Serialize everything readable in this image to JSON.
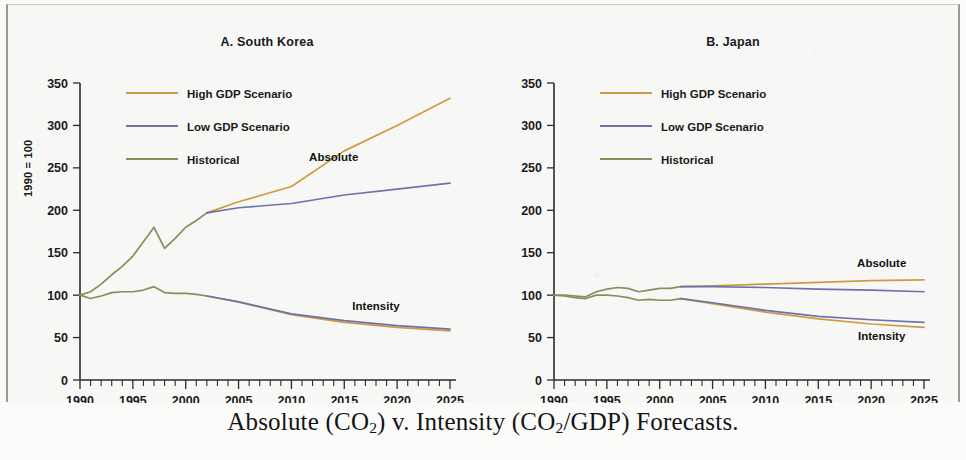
{
  "caption": {
    "prefix": "Absolute (CO",
    "sub1": "2",
    "middle": ") v. Intensity (CO",
    "sub2": "2",
    "suffix": "/GDP) Forecasts."
  },
  "axis_label_y": "1990 = 100",
  "legend": {
    "items": [
      {
        "label": "High GDP Scenario",
        "color": "#d09a42"
      },
      {
        "label": "Low GDP Scenario",
        "color": "#6e72ab"
      },
      {
        "label": "Historical",
        "color": "#8b8c5d"
      }
    ]
  },
  "annotations": {
    "absolute": "Absolute",
    "intensity": "Intensity"
  },
  "colors": {
    "high_gdp": "#d09a42",
    "low_gdp": "#6e72ab",
    "historical": "#8b8c5d",
    "axis": "#2b2b2b",
    "text": "#1a1a1a",
    "background": "#f7f8f6"
  },
  "chart_data": [
    {
      "type": "line",
      "title": "A.  South Korea",
      "xlabel": "",
      "ylabel": "1990 = 100",
      "xlim": [
        1990,
        2025
      ],
      "ylim": [
        0,
        350
      ],
      "yticks": [
        0,
        50,
        100,
        150,
        200,
        250,
        300,
        350
      ],
      "xticks": [
        1990,
        1995,
        2000,
        2005,
        2010,
        2015,
        2020,
        2025
      ],
      "xtick_minor_step": 1,
      "grid": false,
      "legend_position": "upper-left",
      "annotations": [
        {
          "text": "Absolute",
          "x": 2014,
          "y": 258
        },
        {
          "text": "Intensity",
          "x": 2018,
          "y": 82
        }
      ],
      "series": [
        {
          "name": "Historical",
          "measure": "Absolute",
          "color": "#8b8c5d",
          "x": [
            1990,
            1991,
            1992,
            1993,
            1994,
            1995,
            1996,
            1997,
            1998,
            1999,
            2000,
            2001,
            2002
          ],
          "values": [
            100,
            104,
            113,
            124,
            134,
            146,
            163,
            180,
            155,
            167,
            180,
            188,
            197
          ]
        },
        {
          "name": "Historical",
          "measure": "Intensity",
          "color": "#8b8c5d",
          "x": [
            1990,
            1991,
            1992,
            1993,
            1994,
            1995,
            1996,
            1997,
            1998,
            1999,
            2000,
            2001,
            2002
          ],
          "values": [
            100,
            96,
            99,
            103,
            104,
            104,
            106,
            110,
            103,
            102,
            102,
            101,
            99
          ]
        },
        {
          "name": "High GDP Scenario",
          "measure": "Absolute",
          "color": "#d09a42",
          "x": [
            2002,
            2005,
            2010,
            2015,
            2020,
            2025
          ],
          "values": [
            197,
            210,
            228,
            270,
            300,
            332
          ]
        },
        {
          "name": "Low GDP Scenario",
          "measure": "Absolute",
          "color": "#6e72ab",
          "x": [
            2002,
            2005,
            2010,
            2015,
            2020,
            2025
          ],
          "values": [
            197,
            203,
            208,
            218,
            225,
            232
          ]
        },
        {
          "name": "High GDP Scenario",
          "measure": "Intensity",
          "color": "#d09a42",
          "x": [
            2002,
            2005,
            2010,
            2015,
            2020,
            2025
          ],
          "values": [
            99,
            92,
            77,
            68,
            62,
            58
          ]
        },
        {
          "name": "Low GDP Scenario",
          "measure": "Intensity",
          "color": "#6e72ab",
          "x": [
            2002,
            2005,
            2010,
            2015,
            2020,
            2025
          ],
          "values": [
            99,
            92,
            78,
            70,
            64,
            60
          ]
        }
      ]
    },
    {
      "type": "line",
      "title": "B.  Japan",
      "xlabel": "",
      "ylabel": "",
      "xlim": [
        1990,
        2025
      ],
      "ylim": [
        0,
        350
      ],
      "yticks": [
        0,
        50,
        100,
        150,
        200,
        250,
        300,
        350
      ],
      "xticks": [
        1990,
        1995,
        2000,
        2005,
        2010,
        2015,
        2020,
        2025
      ],
      "xtick_minor_step": 1,
      "grid": false,
      "legend_position": "upper-left",
      "annotations": [
        {
          "text": "Absolute",
          "x": 2021,
          "y": 133
        },
        {
          "text": "Intensity",
          "x": 2021,
          "y": 47
        }
      ],
      "series": [
        {
          "name": "Historical",
          "measure": "Absolute",
          "color": "#8b8c5d",
          "x": [
            1990,
            1991,
            1992,
            1993,
            1994,
            1995,
            1996,
            1997,
            1998,
            1999,
            2000,
            2001,
            2002
          ],
          "values": [
            100,
            100,
            99,
            98,
            104,
            107,
            109,
            108,
            104,
            106,
            108,
            108,
            110
          ]
        },
        {
          "name": "Historical",
          "measure": "Intensity",
          "color": "#8b8c5d",
          "x": [
            1990,
            1991,
            1992,
            1993,
            1994,
            1995,
            1996,
            1997,
            1998,
            1999,
            2000,
            2001,
            2002
          ],
          "values": [
            100,
            99,
            97,
            96,
            100,
            100,
            99,
            97,
            94,
            95,
            94,
            94,
            96
          ]
        },
        {
          "name": "High GDP Scenario",
          "measure": "Absolute",
          "color": "#d09a42",
          "x": [
            2002,
            2005,
            2010,
            2015,
            2020,
            2025
          ],
          "values": [
            110,
            111,
            113,
            115,
            117,
            118
          ]
        },
        {
          "name": "Low GDP Scenario",
          "measure": "Absolute",
          "color": "#6e72ab",
          "x": [
            2002,
            2005,
            2010,
            2015,
            2020,
            2025
          ],
          "values": [
            110,
            110,
            109,
            107,
            106,
            104
          ]
        },
        {
          "name": "High GDP Scenario",
          "measure": "Intensity",
          "color": "#d09a42",
          "x": [
            2002,
            2005,
            2010,
            2015,
            2020,
            2025
          ],
          "values": [
            96,
            90,
            80,
            72,
            66,
            62
          ]
        },
        {
          "name": "Low GDP Scenario",
          "measure": "Intensity",
          "color": "#6e72ab",
          "x": [
            2002,
            2005,
            2010,
            2015,
            2020,
            2025
          ],
          "values": [
            96,
            91,
            82,
            75,
            71,
            68
          ]
        }
      ]
    }
  ]
}
